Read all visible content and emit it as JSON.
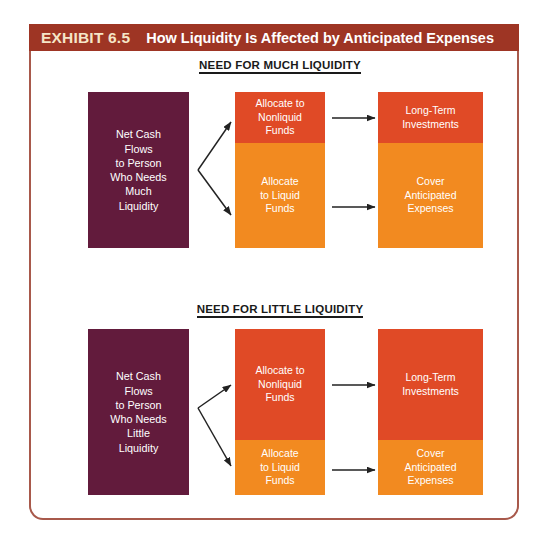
{
  "exhibit": {
    "label": "EXHIBIT 6.5",
    "title": "How Liquidity Is Affected by Anticipated Expenses",
    "header_bg": "#9e3524",
    "label_color": "#f5e6c8",
    "frame_border_color": "#a8594b"
  },
  "colors": {
    "source_box": "#621b3c",
    "nonliquid_box": "#e04a26",
    "liquid_box": "#f28a20",
    "arrow": "#222222",
    "heading_text": "#1a1a1a"
  },
  "sections": [
    {
      "heading": "NEED FOR MUCH LIQUIDITY",
      "source": {
        "lines": [
          "Net Cash",
          "Flows",
          "to Person",
          "Who Needs",
          "Much",
          "Liquidity"
        ]
      },
      "allocation": {
        "nonliquid": {
          "lines": [
            "Allocate to",
            "Nonliquid",
            "Funds"
          ],
          "share_percent": 33
        },
        "liquid": {
          "lines": [
            "Allocate",
            "to Liquid",
            "Funds"
          ],
          "share_percent": 67
        }
      },
      "outcome": {
        "nonliquid": {
          "lines": [
            "Long-Term",
            "Investments"
          ],
          "share_percent": 33
        },
        "liquid": {
          "lines": [
            "Cover",
            "Anticipated",
            "Expenses"
          ],
          "share_percent": 67
        }
      }
    },
    {
      "heading": "NEED FOR LITTLE LIQUIDITY",
      "source": {
        "lines": [
          "Net Cash",
          "Flows",
          "to Person",
          "Who Needs",
          "Little",
          "Liquidity"
        ]
      },
      "allocation": {
        "nonliquid": {
          "lines": [
            "Allocate to",
            "Nonliquid",
            "Funds"
          ],
          "share_percent": 67
        },
        "liquid": {
          "lines": [
            "Allocate",
            "to Liquid",
            "Funds"
          ],
          "share_percent": 33
        }
      },
      "outcome": {
        "nonliquid": {
          "lines": [
            "Long-Term",
            "Investments"
          ],
          "share_percent": 67
        },
        "liquid": {
          "lines": [
            "Cover",
            "Anticipated",
            "Expenses"
          ],
          "share_percent": 33
        }
      }
    }
  ]
}
